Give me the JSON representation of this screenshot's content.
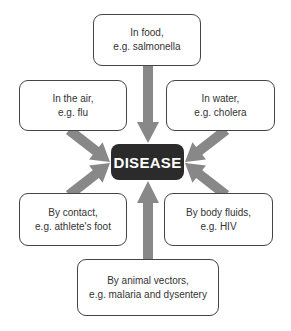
{
  "center": {
    "label": "DISEASE"
  },
  "nodes": [
    {
      "id": "food",
      "line1": "In food,",
      "line2": "e.g. salmonella"
    },
    {
      "id": "air",
      "line1": "In the air,",
      "line2": "e.g. flu"
    },
    {
      "id": "water",
      "line1": "In water,",
      "line2": "e.g. cholera"
    },
    {
      "id": "contact",
      "line1": "By contact,",
      "line2": "e.g. athlete's foot"
    },
    {
      "id": "fluids",
      "line1": "By body fluids,",
      "line2": "e.g. HIV"
    },
    {
      "id": "vectors",
      "line1": "By animal vectors,",
      "line2": "e.g. malaria and dysentery"
    }
  ],
  "colors": {
    "arrow": "#888888",
    "center_bg": "#2b2b2b",
    "border": "#444444"
  }
}
